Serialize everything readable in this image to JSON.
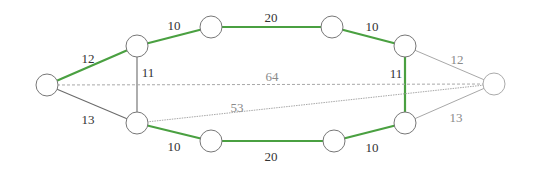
{
  "diagram": {
    "type": "weighted-graph",
    "colors": {
      "highlight_edge": "#4aa041",
      "normal_edge": "#6b6b6b",
      "faint_edge": "#a8a8a8",
      "node_stroke": "#777777",
      "node_fill": "#ffffff",
      "label_dark": "#333333",
      "label_faint": "#8a8a8a"
    },
    "nodes": [
      {
        "id": "n0",
        "x": 47,
        "y": 85
      },
      {
        "id": "n1",
        "x": 137,
        "y": 46
      },
      {
        "id": "n2",
        "x": 211,
        "y": 27
      },
      {
        "id": "n3",
        "x": 332,
        "y": 27
      },
      {
        "id": "n4",
        "x": 405,
        "y": 46
      },
      {
        "id": "n5",
        "x": 494,
        "y": 84
      },
      {
        "id": "n6",
        "x": 137,
        "y": 123
      },
      {
        "id": "n7",
        "x": 211,
        "y": 141
      },
      {
        "id": "n8",
        "x": 334,
        "y": 141
      },
      {
        "id": "n9",
        "x": 405,
        "y": 123
      }
    ],
    "edges": [
      {
        "from": "n0",
        "to": "n1",
        "weight": "12",
        "style": "highlight",
        "lx": 88,
        "ly": 60
      },
      {
        "from": "n1",
        "to": "n2",
        "weight": "10",
        "style": "highlight",
        "lx": 174,
        "ly": 27
      },
      {
        "from": "n2",
        "to": "n3",
        "weight": "20",
        "style": "highlight",
        "lx": 271,
        "ly": 19
      },
      {
        "from": "n3",
        "to": "n4",
        "weight": "10",
        "style": "highlight",
        "lx": 372,
        "ly": 28
      },
      {
        "from": "n4",
        "to": "n9",
        "weight": "11",
        "style": "highlight",
        "lx": 396,
        "ly": 75
      },
      {
        "from": "n4",
        "to": "n5",
        "weight": "12",
        "style": "faint",
        "lx": 457,
        "ly": 61
      },
      {
        "from": "n9",
        "to": "n5",
        "weight": "13",
        "style": "faint",
        "lx": 456,
        "ly": 119
      },
      {
        "from": "n0",
        "to": "n6",
        "weight": "13",
        "style": "normal",
        "lx": 88,
        "ly": 121
      },
      {
        "from": "n1",
        "to": "n6",
        "weight": "11",
        "style": "normal",
        "lx": 148,
        "ly": 74
      },
      {
        "from": "n6",
        "to": "n7",
        "weight": "10",
        "style": "highlight",
        "lx": 174,
        "ly": 148
      },
      {
        "from": "n7",
        "to": "n8",
        "weight": "20",
        "style": "highlight",
        "lx": 271,
        "ly": 158
      },
      {
        "from": "n8",
        "to": "n9",
        "weight": "10",
        "style": "highlight",
        "lx": 372,
        "ly": 149
      },
      {
        "from": "n0",
        "to": "n5",
        "weight": "64",
        "style": "dashed",
        "lx": 272,
        "ly": 78
      },
      {
        "from": "n6",
        "to": "n5",
        "weight": "53",
        "style": "dotted",
        "lx": 237,
        "ly": 109
      }
    ]
  }
}
